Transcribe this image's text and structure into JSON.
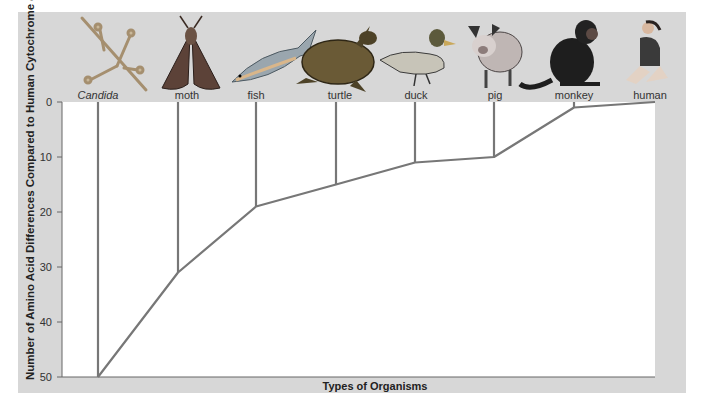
{
  "chart_data": {
    "type": "line",
    "title": "",
    "xlabel": "Types of Organisms",
    "ylabel": "Number of Amino Acid Differences Compared to Human Cytochrome c",
    "ylabel_main": "Number of Amino Acid Differences Compared to Human Cytochrome ",
    "ylabel_italic": "c",
    "ylim": [
      0,
      50
    ],
    "y_inverted": true,
    "yticks": [
      0,
      10,
      20,
      30,
      40,
      50
    ],
    "grid": false,
    "legend": "none",
    "categories": [
      "Candida",
      "moth",
      "fish",
      "turtle",
      "duck",
      "pig",
      "monkey",
      "human"
    ],
    "values": [
      51,
      31,
      19,
      15,
      11,
      10,
      1,
      0
    ],
    "note": "Tree-like line: each organism has a vertical line from the top meeting the branching curve at its difference value"
  },
  "ticks": [
    "0",
    "10",
    "20",
    "30",
    "40",
    "50"
  ],
  "organisms": [
    {
      "name": "Candida",
      "icon": "candida-fungus-icon",
      "italic": true
    },
    {
      "name": "moth",
      "icon": "moth-icon",
      "italic": false
    },
    {
      "name": "fish",
      "icon": "fish-icon",
      "italic": false
    },
    {
      "name": "turtle",
      "icon": "turtle-icon",
      "italic": false
    },
    {
      "name": "duck",
      "icon": "duck-icon",
      "italic": false
    },
    {
      "name": "pig",
      "icon": "pig-icon",
      "italic": false
    },
    {
      "name": "monkey",
      "icon": "monkey-icon",
      "italic": false
    },
    {
      "name": "human",
      "icon": "human-icon",
      "italic": false
    }
  ],
  "colors": {
    "panel": "#d7d7d7",
    "plot": "#ffffff",
    "line": "#777777",
    "text": "#222222"
  }
}
